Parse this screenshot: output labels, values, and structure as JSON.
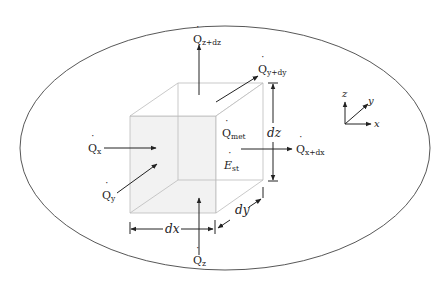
{
  "diagram": {
    "colors": {
      "stroke": "#222222",
      "cube_edge": "#bbbbbb",
      "cube_fill": "#f2f2f2",
      "ellipse": "#444444"
    },
    "labels": {
      "q_z_dz": {
        "base": "Q",
        "sub": "z+dz"
      },
      "q_y_dy": {
        "base": "Q",
        "sub": "y+dy"
      },
      "q_x": {
        "base": "Q",
        "sub": "x"
      },
      "q_y": {
        "base": "Q",
        "sub": "y"
      },
      "q_met": {
        "base": "Q",
        "sub": "met"
      },
      "e_st": {
        "base": "E",
        "sub": "st"
      },
      "q_x_dx": {
        "base": "Q",
        "sub": "x+dx"
      },
      "q_z": {
        "base": "Q",
        "sub": "z"
      },
      "dz": "dz",
      "dx": "dx",
      "dy": "dy"
    },
    "axes": {
      "x": "x",
      "y": "y",
      "z": "z"
    }
  }
}
